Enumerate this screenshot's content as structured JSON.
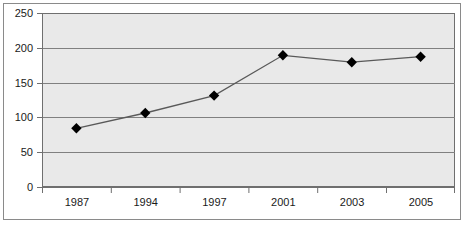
{
  "chart_data": {
    "type": "line",
    "title": "",
    "subtitle": "",
    "xlabel": "",
    "ylabel": "",
    "categories": [
      "1987",
      "1994",
      "1997",
      "2001",
      "2003",
      "2005"
    ],
    "values": [
      85,
      107,
      132,
      190,
      180,
      188
    ],
    "series": [
      {
        "name": "",
        "values": [
          85,
          107,
          132,
          190,
          180,
          188
        ]
      }
    ],
    "ylim": [
      0,
      250
    ],
    "y_ticks": [
      0,
      50,
      100,
      150,
      200,
      250
    ],
    "x_ticks": [
      "1987",
      "1994",
      "1997",
      "2001",
      "2003",
      "2005"
    ],
    "grid": "horizontal",
    "legend": "none",
    "marker": "diamond",
    "colors": {
      "plot_background": "#e9e9e9",
      "gridline": "#808080",
      "series_line": "#595959",
      "marker_fill": "#000000",
      "axis": "#6f6f6f",
      "frame": "#8a8a8a",
      "text": "#1a1a1a"
    }
  },
  "axes": {
    "y_labels": [
      "250",
      "200",
      "150",
      "100",
      "50",
      "0"
    ],
    "x_labels": [
      "1987",
      "1994",
      "1997",
      "2001",
      "2003",
      "2005"
    ]
  }
}
